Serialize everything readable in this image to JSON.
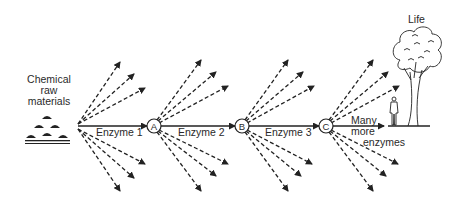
{
  "diagram": {
    "source_label": [
      "Chemical",
      "raw",
      "materials"
    ],
    "edges": [
      {
        "from": "raw materials",
        "to": "A",
        "label": "Enzyme 1"
      },
      {
        "from": "A",
        "to": "B",
        "label": "Enzyme 2"
      },
      {
        "from": "B",
        "to": "C",
        "label": "Enzyme 3"
      },
      {
        "from": "C",
        "to": "Life",
        "label": "Many more enzymes"
      }
    ],
    "nodes": [
      "A",
      "B",
      "C"
    ],
    "final_label": "Life",
    "many_more": [
      "Many",
      "more",
      "enzymes"
    ],
    "side_branches_per_node": 6,
    "colors": {
      "ink": "#222222",
      "background": "#ffffff"
    }
  }
}
